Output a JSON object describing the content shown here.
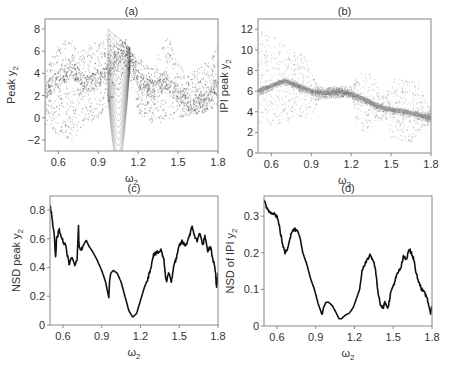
{
  "chart_data": [
    {
      "id": "a",
      "type": "scatter",
      "title": "(a)",
      "xlabel": "ω2",
      "ylabel": "Peak y2",
      "xlim": [
        0.5,
        1.8
      ],
      "ylim": [
        -3,
        8.9
      ],
      "xticks": [
        0.6,
        0.9,
        1.2,
        1.5,
        1.8
      ],
      "xtick_labels": [
        "0.6",
        "0.9",
        "1.2",
        "1.5",
        "1.8"
      ],
      "yticks": [
        -2,
        0,
        2,
        4,
        6,
        8
      ],
      "ytick_labels": [
        "-2",
        "0",
        "2",
        "4",
        "6",
        "8"
      ],
      "grid": false,
      "color": "#333333",
      "description": "Dense point cloud of peak y2 values vs ω2; upper envelope peaks near 7.5 at ω2≈0.68, 8 at ω2≈0.97, 7.5 at ω2≈1.42; dense banded structure 2–8 between 0.97–1.15; cluster near 0–2 around 1.55–1.75",
      "envelope_upper": {
        "x": [
          0.5,
          0.6,
          0.68,
          0.75,
          0.85,
          0.95,
          0.97,
          1.1,
          1.2,
          1.3,
          1.38,
          1.42,
          1.47,
          1.55,
          1.65,
          1.75,
          1.8
        ],
        "y": [
          4.5,
          6.5,
          7.6,
          6.0,
          6.8,
          7.0,
          8.1,
          6.8,
          5.5,
          4.5,
          6.5,
          7.5,
          6.0,
          4.0,
          4.5,
          5.5,
          7.0
        ]
      },
      "envelope_lower": {
        "x": [
          0.5,
          0.6,
          0.7,
          0.8,
          0.9,
          1.0,
          1.05,
          1.1,
          1.2,
          1.3,
          1.4,
          1.5,
          1.6,
          1.7,
          1.8
        ],
        "y": [
          -0.5,
          -1.5,
          -2.0,
          -0.5,
          0.0,
          1.8,
          2.5,
          5.0,
          0.5,
          -0.5,
          -0.5,
          0.0,
          0.3,
          0.5,
          1.0
        ]
      },
      "band_center": {
        "x": [
          0.5,
          0.6,
          0.7,
          0.8,
          0.9,
          1.0,
          1.1,
          1.13,
          1.2,
          1.3,
          1.4,
          1.5,
          1.6,
          1.7,
          1.8
        ],
        "y": [
          2.5,
          3.5,
          4.5,
          3.0,
          3.5,
          4.5,
          6.5,
          6.0,
          3.5,
          2.5,
          3.5,
          2.0,
          1.3,
          1.5,
          3.0
        ]
      }
    },
    {
      "id": "b",
      "type": "scatter",
      "title": "(b)",
      "xlabel": "ω2",
      "ylabel": "IPI peak y2",
      "xlim": [
        0.5,
        1.8
      ],
      "ylim": [
        0,
        13
      ],
      "xticks": [
        0.6,
        0.9,
        1.2,
        1.5,
        1.8
      ],
      "xtick_labels": [
        "0.6",
        "0.9",
        "1.2",
        "1.5",
        "1.8"
      ],
      "yticks": [
        0,
        2,
        4,
        6,
        8,
        10,
        12
      ],
      "ytick_labels": [
        "0",
        "2",
        "4",
        "6",
        "8",
        "10",
        "12"
      ],
      "grid": false,
      "color": "#777777",
      "description": "Point cloud of inter-peak interval of y2 vs ω2; broad scatter 3–12 for ω2<0.7, main band decreasing from ~7 at 0.7 to ~3.5 at 1.8, scatter clouds 2–8 around 1.25–1.35 and 1.5–1.7",
      "band_center": {
        "x": [
          0.5,
          0.6,
          0.7,
          0.8,
          0.9,
          1.0,
          1.1,
          1.2,
          1.3,
          1.4,
          1.5,
          1.6,
          1.7,
          1.8
        ],
        "y": [
          6.0,
          6.5,
          7.0,
          6.5,
          6.0,
          5.8,
          6.0,
          5.7,
          5.2,
          4.5,
          4.2,
          4.0,
          3.7,
          3.4
        ]
      },
      "envelope_upper": {
        "x": [
          0.5,
          0.6,
          0.7,
          0.8,
          0.85,
          0.9,
          0.95,
          1.2,
          1.25,
          1.35,
          1.45,
          1.5,
          1.7,
          1.8
        ],
        "y": [
          12.3,
          11.5,
          10.5,
          9.8,
          9.5,
          8.0,
          6.5,
          6.5,
          7.8,
          7.8,
          5.5,
          7.3,
          7.0,
          4.0
        ]
      },
      "envelope_lower": {
        "x": [
          0.5,
          0.6,
          0.7,
          0.8,
          0.9,
          0.95,
          1.2,
          1.25,
          1.35,
          1.45,
          1.5,
          1.65,
          1.75,
          1.8
        ],
        "y": [
          3.0,
          2.5,
          3.0,
          3.5,
          3.5,
          5.2,
          5.5,
          2.0,
          2.5,
          3.5,
          1.5,
          1.0,
          2.5,
          3.0
        ]
      }
    },
    {
      "id": "c",
      "type": "line",
      "title": "(c)",
      "xlabel": "ω2",
      "ylabel": "NSD peak y2",
      "xlim": [
        0.5,
        1.8
      ],
      "ylim": [
        0,
        0.897
      ],
      "xticks": [
        0.6,
        0.9,
        1.2,
        1.5,
        1.8
      ],
      "xtick_labels": [
        "0.6",
        "0.9",
        "1.2",
        "1.5",
        "1.8"
      ],
      "yticks": [
        0,
        0.2,
        0.4,
        0.6,
        0.8
      ],
      "ytick_labels": [
        "0",
        "0.2",
        "0.4",
        "0.6",
        "0.8"
      ],
      "grid": false,
      "color": "#111111",
      "x": [
        0.5,
        0.51,
        0.53,
        0.545,
        0.55,
        0.56,
        0.57,
        0.59,
        0.62,
        0.65,
        0.67,
        0.69,
        0.71,
        0.72,
        0.725,
        0.73,
        0.75,
        0.78,
        0.8,
        0.83,
        0.86,
        0.9,
        0.93,
        0.955,
        0.96,
        0.97,
        0.99,
        1.02,
        1.05,
        1.08,
        1.11,
        1.14,
        1.17,
        1.2,
        1.23,
        1.26,
        1.28,
        1.3,
        1.33,
        1.36,
        1.38,
        1.4,
        1.42,
        1.44,
        1.46,
        1.48,
        1.5,
        1.52,
        1.55,
        1.57,
        1.6,
        1.62,
        1.64,
        1.66,
        1.68,
        1.7,
        1.72,
        1.74,
        1.76,
        1.78,
        1.79,
        1.8
      ],
      "y": [
        0.83,
        0.78,
        0.65,
        0.46,
        0.6,
        0.62,
        0.67,
        0.6,
        0.55,
        0.42,
        0.47,
        0.42,
        0.44,
        0.7,
        0.55,
        0.52,
        0.54,
        0.59,
        0.55,
        0.51,
        0.46,
        0.38,
        0.3,
        0.19,
        0.3,
        0.36,
        0.38,
        0.36,
        0.3,
        0.2,
        0.1,
        0.055,
        0.08,
        0.17,
        0.26,
        0.33,
        0.4,
        0.49,
        0.5,
        0.52,
        0.46,
        0.3,
        0.37,
        0.3,
        0.42,
        0.47,
        0.55,
        0.58,
        0.55,
        0.6,
        0.68,
        0.62,
        0.58,
        0.65,
        0.55,
        0.62,
        0.5,
        0.55,
        0.46,
        0.38,
        0.24,
        0.37
      ]
    },
    {
      "id": "d",
      "type": "line",
      "title": "(d)",
      "xlabel": "ω2",
      "ylabel": "NSD of IPI y2",
      "xlim": [
        0.5,
        1.8
      ],
      "ylim": [
        0,
        0.355
      ],
      "xticks": [
        0.6,
        0.9,
        1.2,
        1.5,
        1.8
      ],
      "xtick_labels": [
        "0.6",
        "0.9",
        "1.2",
        "1.5",
        "1.8"
      ],
      "yticks": [
        0,
        0.1,
        0.2,
        0.3
      ],
      "ytick_labels": [
        "0",
        "0.1",
        "0.2",
        "0.3"
      ],
      "grid": false,
      "color": "#111111",
      "x": [
        0.5,
        0.52,
        0.55,
        0.57,
        0.6,
        0.62,
        0.64,
        0.66,
        0.68,
        0.7,
        0.72,
        0.74,
        0.76,
        0.78,
        0.8,
        0.83,
        0.86,
        0.89,
        0.92,
        0.95,
        0.96,
        0.98,
        1.0,
        1.03,
        1.06,
        1.08,
        1.1,
        1.13,
        1.16,
        1.19,
        1.22,
        1.24,
        1.26,
        1.28,
        1.3,
        1.32,
        1.34,
        1.36,
        1.38,
        1.4,
        1.42,
        1.44,
        1.46,
        1.48,
        1.5,
        1.53,
        1.56,
        1.58,
        1.6,
        1.62,
        1.64,
        1.66,
        1.68,
        1.7,
        1.72,
        1.74,
        1.76,
        1.78,
        1.79,
        1.8
      ],
      "y": [
        0.345,
        0.32,
        0.31,
        0.31,
        0.3,
        0.27,
        0.23,
        0.2,
        0.21,
        0.24,
        0.26,
        0.265,
        0.26,
        0.24,
        0.2,
        0.17,
        0.13,
        0.1,
        0.06,
        0.03,
        0.05,
        0.065,
        0.065,
        0.055,
        0.035,
        0.02,
        0.02,
        0.03,
        0.035,
        0.05,
        0.08,
        0.1,
        0.155,
        0.17,
        0.18,
        0.195,
        0.185,
        0.16,
        0.1,
        0.06,
        0.05,
        0.065,
        0.05,
        0.09,
        0.11,
        0.14,
        0.16,
        0.19,
        0.18,
        0.21,
        0.2,
        0.18,
        0.14,
        0.12,
        0.1,
        0.09,
        0.08,
        0.05,
        0.025,
        0.06
      ]
    }
  ],
  "layout": {
    "panels": {
      "a": {
        "left": 45,
        "top": 19,
        "right": 218,
        "bottom": 151
      },
      "b": {
        "left": 258,
        "top": 19,
        "right": 431,
        "bottom": 153
      },
      "c": {
        "left": 50,
        "top": 196,
        "right": 218,
        "bottom": 325
      },
      "d": {
        "left": 264,
        "top": 196,
        "right": 432,
        "bottom": 326
      }
    }
  }
}
